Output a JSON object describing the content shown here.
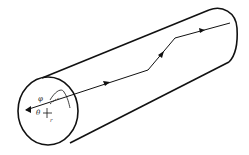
{
  "diagram": {
    "labels": {
      "phi": "φ",
      "theta": "θ",
      "r": "r",
      "tick": "r"
    },
    "colors": {
      "stroke": "#111111",
      "background": "#ffffff"
    }
  }
}
